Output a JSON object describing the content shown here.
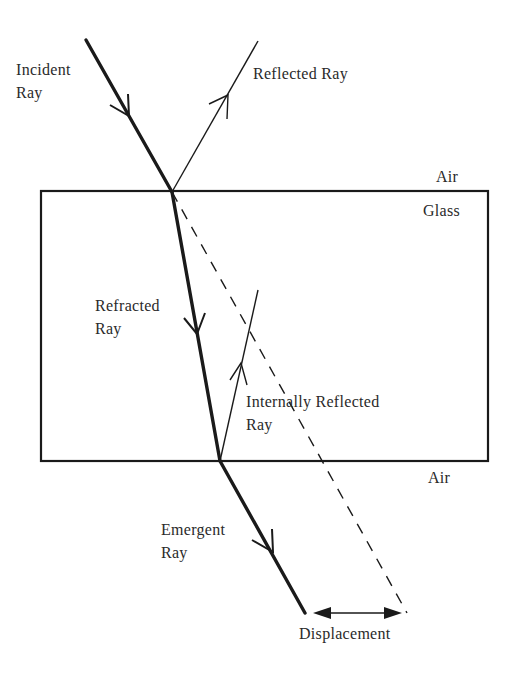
{
  "diagram": {
    "colors": {
      "ink": "#1a1a1a",
      "text": "#2a2a2a",
      "background": "#ffffff"
    },
    "labels": {
      "incident_1": "Incident",
      "incident_2": "Ray",
      "reflected": "Reflected Ray",
      "air_top": "Air",
      "glass": "Glass",
      "refracted_1": "Refracted",
      "refracted_2": "Ray",
      "internal_1": "Internally Reflected",
      "internal_2": "Ray",
      "air_bottom": "Air",
      "emergent_1": "Emergent",
      "emergent_2": "Ray",
      "displacement": "Displacement"
    },
    "media": [
      "Air",
      "Glass",
      "Air"
    ]
  }
}
